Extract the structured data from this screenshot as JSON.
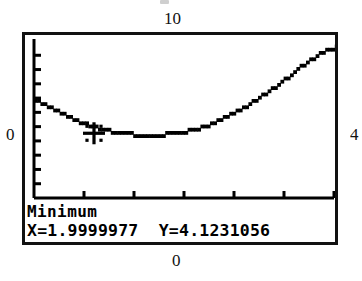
{
  "device": {
    "kind": "graphing-calculator-screen",
    "operation_label": "Minimum"
  },
  "annotations": {
    "top_label": "10",
    "left_label": "0",
    "right_label": "4",
    "bottom_label": "0"
  },
  "readout": {
    "title": "Minimum",
    "x_text": "X=1.9999977",
    "y_text": "Y=4.1231056",
    "values_line": "X=1.9999977  Y=4.1231056",
    "x_value": 1.9999977,
    "y_value": 4.1231056
  },
  "colors": {
    "ink": "#111111",
    "screen_background": "#ffffff",
    "trace": "#000000"
  },
  "chart_data": {
    "type": "line",
    "title": "",
    "xlabel": "",
    "ylabel": "",
    "xlim": [
      0,
      10
    ],
    "ylim": [
      0,
      10
    ],
    "grid": false,
    "legend": null,
    "axis_style": "ticks-only",
    "x_tick_count": 5,
    "y_tick_count": 10,
    "series": [
      {
        "name": "y1",
        "x": [
          0.0,
          0.5,
          1.0,
          1.5,
          2.0,
          2.5,
          3.0,
          3.5,
          4.0,
          4.5,
          5.0,
          5.5,
          6.0,
          6.5,
          7.0,
          7.5,
          8.0,
          8.5,
          9.0,
          9.5,
          10.0
        ],
        "y": [
          6.4,
          5.85,
          5.4,
          4.95,
          4.6,
          4.35,
          4.2,
          4.13,
          4.12,
          4.2,
          4.35,
          4.6,
          4.95,
          5.4,
          5.95,
          6.55,
          7.2,
          7.95,
          8.75,
          9.35,
          9.75
        ]
      }
    ],
    "markers": [
      {
        "name": "minimum-cursor",
        "glyph": "crosshair",
        "x": 1.9999977,
        "y": 4.1231056,
        "label": "Minimum"
      }
    ]
  }
}
